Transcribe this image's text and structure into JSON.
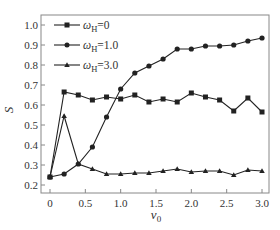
{
  "chart_data": {
    "type": "line",
    "title": "",
    "xlabel": "v0",
    "xlabel_main": "v",
    "xlabel_sub": "0",
    "ylabel": "S",
    "xlim": [
      -0.1,
      3.1
    ],
    "ylim": [
      0.16,
      1.05
    ],
    "xticks": [
      0,
      0.5,
      1.0,
      1.5,
      2.0,
      2.5,
      3.0
    ],
    "xtick_labels": [
      "0",
      "0.5",
      "1.0",
      "1.5",
      "2.0",
      "2.5",
      "3.0"
    ],
    "yticks": [
      0.2,
      0.3,
      0.4,
      0.5,
      0.6,
      0.7,
      0.8,
      0.9,
      1.0
    ],
    "ytick_labels": [
      "0.2",
      "0.3",
      "0.4",
      "0.5",
      "0.6",
      "0.7",
      "0.8",
      "0.9",
      "1.0"
    ],
    "grid": false,
    "legend_position": "upper left",
    "x": [
      0,
      0.2,
      0.4,
      0.6,
      0.8,
      1.0,
      1.2,
      1.4,
      1.6,
      1.8,
      2.0,
      2.2,
      2.4,
      2.6,
      2.8,
      3.0
    ],
    "series": [
      {
        "name": "ωH=0",
        "legend_main": "ω",
        "legend_sub": "H",
        "legend_value": "=0",
        "marker": "square",
        "values": [
          0.24,
          0.665,
          0.65,
          0.625,
          0.64,
          0.63,
          0.65,
          0.615,
          0.63,
          0.615,
          0.66,
          0.64,
          0.625,
          0.57,
          0.635,
          0.565
        ]
      },
      {
        "name": "ωH=1.0",
        "legend_main": "ω",
        "legend_sub": "H",
        "legend_value": "=1.0",
        "marker": "circle",
        "values": [
          0.24,
          0.255,
          0.305,
          0.39,
          0.54,
          0.68,
          0.76,
          0.795,
          0.83,
          0.88,
          0.88,
          0.895,
          0.895,
          0.9,
          0.92,
          0.935
        ]
      },
      {
        "name": "ωH=3.0",
        "legend_main": "ω",
        "legend_sub": "H",
        "legend_value": "=3.0",
        "marker": "triangle",
        "values": [
          0.24,
          0.545,
          0.305,
          0.28,
          0.255,
          0.255,
          0.26,
          0.26,
          0.27,
          0.28,
          0.265,
          0.27,
          0.27,
          0.25,
          0.275,
          0.27
        ]
      }
    ],
    "colors": {
      "line": "#222222",
      "axis": "#888888",
      "text": "#333333"
    }
  }
}
